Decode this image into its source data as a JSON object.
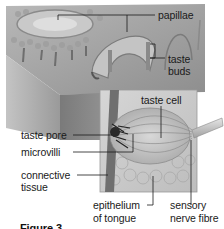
{
  "figure": {
    "caption_partial": "Figure 3",
    "style": "grayscale illustration"
  },
  "labels": {
    "papillae": "papillae",
    "taste_buds_line1": "taste",
    "taste_buds_line2": "buds",
    "taste_cell": "taste cell",
    "taste_pore": "taste pore",
    "microvilli": "microvilli",
    "connective_tissue_line1": "connective",
    "connective_tissue_line2": "tissue",
    "epithelium_line1": "epithelium",
    "epithelium_line2": "of tongue",
    "sensory_nerve_line1": "sensory",
    "sensory_nerve_line2": "nerve fibre"
  }
}
